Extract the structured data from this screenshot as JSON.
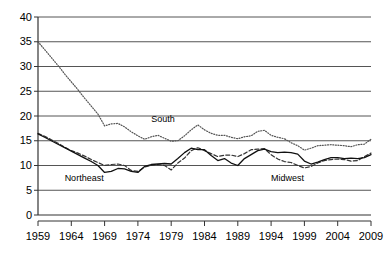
{
  "chart_data": {
    "type": "line",
    "title": "",
    "subtitle": "",
    "xlabel": "",
    "ylabel": "",
    "xlim": [
      1959,
      2009
    ],
    "ylim": [
      0,
      40
    ],
    "ygrid": true,
    "xgrid": false,
    "legend_position": "inline-annotations",
    "ytick_labels": [
      "0",
      "5",
      "10",
      "15",
      "20",
      "25",
      "30",
      "35",
      "40"
    ],
    "ytick_values": [
      0,
      5,
      10,
      15,
      20,
      25,
      30,
      35,
      40
    ],
    "xtick_labels": [
      "1959",
      "1964",
      "1969",
      "1974",
      "1979",
      "1984",
      "1989",
      "1994",
      "1999",
      "2004",
      "2009"
    ],
    "xtick_values": [
      1959,
      1964,
      1969,
      1974,
      1979,
      1984,
      1989,
      1994,
      1999,
      2004,
      2009
    ],
    "x": [
      1959,
      1960,
      1961,
      1962,
      1963,
      1964,
      1965,
      1966,
      1967,
      1968,
      1969,
      1970,
      1971,
      1972,
      1973,
      1974,
      1975,
      1976,
      1977,
      1978,
      1979,
      1980,
      1981,
      1982,
      1983,
      1984,
      1985,
      1986,
      1987,
      1988,
      1989,
      1990,
      1991,
      1992,
      1993,
      1994,
      1995,
      1996,
      1997,
      1998,
      1999,
      2000,
      2001,
      2002,
      2003,
      2004,
      2005,
      2006,
      2007,
      2008,
      2009
    ],
    "series": [
      {
        "name": "South",
        "style": "dotted",
        "color": "#555555",
        "values": [
          35.0,
          33.4,
          31.8,
          30.2,
          28.5,
          26.9,
          25.3,
          23.6,
          22.0,
          20.4,
          18.0,
          18.4,
          18.5,
          17.8,
          16.8,
          16.0,
          15.3,
          15.8,
          16.1,
          15.5,
          14.9,
          15.0,
          16.0,
          17.2,
          18.2,
          17.2,
          16.5,
          16.1,
          16.1,
          15.7,
          15.4,
          15.8,
          16.0,
          16.9,
          17.1,
          16.1,
          15.7,
          15.4,
          14.6,
          14.0,
          13.1,
          13.5,
          14.0,
          14.1,
          14.2,
          14.1,
          14.0,
          13.8,
          14.2,
          14.3,
          15.3
        ]
      },
      {
        "name": "Midwest",
        "style": "dashed",
        "color": "#333333",
        "values": [
          16.5,
          15.9,
          15.2,
          14.5,
          13.7,
          13.0,
          12.5,
          11.9,
          11.2,
          10.6,
          10.0,
          10.2,
          10.3,
          10.0,
          9.0,
          8.8,
          9.7,
          10.0,
          10.2,
          10.0,
          9.1,
          10.5,
          11.5,
          13.0,
          13.6,
          13.0,
          12.4,
          11.8,
          12.1,
          12.1,
          11.8,
          12.4,
          13.2,
          13.3,
          13.4,
          12.2,
          11.3,
          10.8,
          10.6,
          10.0,
          9.5,
          9.8,
          10.5,
          11.0,
          11.2,
          11.3,
          11.2,
          10.9,
          11.0,
          11.8,
          12.5
        ]
      },
      {
        "name": "Northeast",
        "style": "solid",
        "color": "#111111",
        "values": [
          16.4,
          15.7,
          15.0,
          14.3,
          13.6,
          12.9,
          12.2,
          11.5,
          10.8,
          10.0,
          8.6,
          8.8,
          9.4,
          9.3,
          8.8,
          8.6,
          9.8,
          10.2,
          10.3,
          10.4,
          10.3,
          11.4,
          12.6,
          13.5,
          13.2,
          13.2,
          12.0,
          11.0,
          11.4,
          10.5,
          10.0,
          11.4,
          12.2,
          13.0,
          13.3,
          12.8,
          12.6,
          12.7,
          12.6,
          12.3,
          10.9,
          10.3,
          10.7,
          11.2,
          11.6,
          11.6,
          11.4,
          11.5,
          11.4,
          11.6,
          12.2
        ]
      }
    ],
    "annotations": [
      {
        "text": "South",
        "x": 1976,
        "y": 19.2
      },
      {
        "text": "Northeast",
        "x": 1963,
        "y": 7.3
      },
      {
        "text": "Midwest",
        "x": 1994,
        "y": 7.3
      }
    ]
  }
}
